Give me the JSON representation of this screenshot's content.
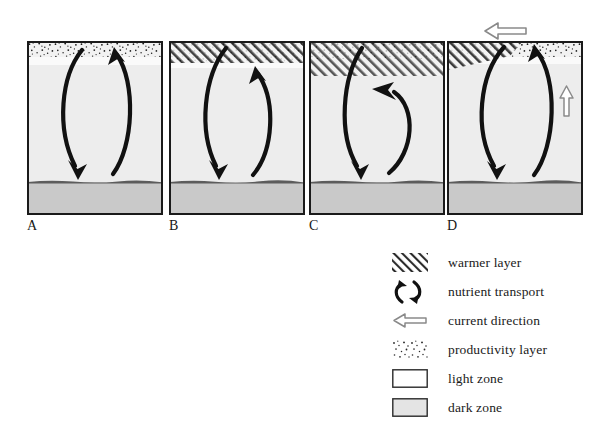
{
  "figure": {
    "type": "scientific-diagram",
    "panel_count": 4
  },
  "panels": [
    {
      "id": "A",
      "label": "A",
      "layers": {
        "productivity_layer": true,
        "warmer_layer": false,
        "light_zone": true,
        "dark_zone": true
      },
      "nutrient_transport": "full-depth circulation, down-arrow and up-arrow reach the dark zone boundary and the productivity layer",
      "current_direction_arrows": []
    },
    {
      "id": "B",
      "label": "B",
      "layers": {
        "productivity_layer": true,
        "warmer_layer": true,
        "light_zone": true,
        "dark_zone": true
      },
      "nutrient_transport": "full-depth circulation, up-arrow terminates just below the warmer layer",
      "current_direction_arrows": []
    },
    {
      "id": "C",
      "label": "C",
      "layers": {
        "productivity_layer": true,
        "warmer_layer": true,
        "light_zone": true,
        "dark_zone": true
      },
      "nutrient_transport": "shallow circulation, up-arrow turns back below a thickened warmer layer",
      "current_direction_arrows": []
    },
    {
      "id": "D",
      "label": "D",
      "layers": {
        "productivity_layer": true,
        "warmer_layer": true,
        "light_zone": true,
        "dark_zone": true
      },
      "nutrient_transport": "full-depth circulation reaching the productivity layer",
      "current_direction_arrows": [
        "left",
        "up"
      ]
    }
  ],
  "legend": {
    "items": [
      {
        "icon": "hatch-pattern-icon",
        "label": "warmer layer"
      },
      {
        "icon": "nutrient-transport-icon",
        "label": "nutrient transport"
      },
      {
        "icon": "hollow-left-arrow-icon",
        "label": "current direction"
      },
      {
        "icon": "stipple-pattern-icon",
        "label": "productivity layer"
      },
      {
        "icon": "light-zone-swatch-icon",
        "label": "light zone"
      },
      {
        "icon": "dark-zone-swatch-icon",
        "label": "dark zone"
      }
    ]
  },
  "colors": {
    "outline": "#1a1a1a",
    "light_zone": "#ededed",
    "dark_zone": "#c9c9c9",
    "white_zone": "#f7f7f7",
    "arrow": "#111111",
    "hollow_arrow": "#8a8a8a",
    "text": "#1a1a1a"
  }
}
